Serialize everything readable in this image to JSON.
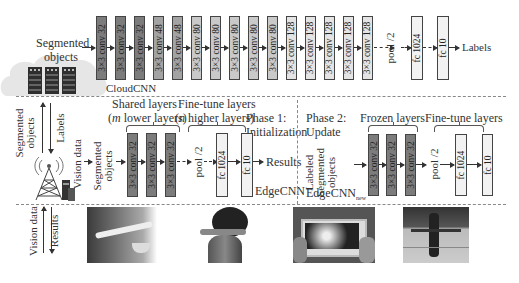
{
  "cloud": {
    "input_label_line1": "Segmented",
    "input_label_line2": "objects",
    "network_name": "CloudCNN",
    "layers": [
      {
        "label": "3×3 conv 32",
        "shade": "dark"
      },
      {
        "label": "3×3 conv 32",
        "shade": "dark"
      },
      {
        "label": "3×3 conv 32",
        "shade": "dark"
      },
      {
        "label": "3×3 conv 48",
        "shade": "mid"
      },
      {
        "label": "3×3 conv 48",
        "shade": "mid"
      },
      {
        "label": "3×3 conv 80",
        "shade": "lite"
      },
      {
        "label": "3×3 conv 80",
        "shade": "lite"
      },
      {
        "label": "3×3 conv 80",
        "shade": "lite"
      },
      {
        "label": "3×3 conv 80",
        "shade": "lite"
      },
      {
        "label": "3×3 conv 80",
        "shade": "lite"
      },
      {
        "label": "3×3 conv 128",
        "shade": "pale"
      },
      {
        "label": "3×3 conv 128",
        "shade": "pale"
      },
      {
        "label": "3×3 conv 128",
        "shade": "pale"
      },
      {
        "label": "3×3 conv 128",
        "shade": "pale"
      },
      {
        "label": "3×3 conv 128",
        "shade": "pale"
      }
    ],
    "pool_label": "pool /2",
    "fc1_label": "fc 1024",
    "fc2_label": "fc 10",
    "output_label": "Labels"
  },
  "link_cloud_edge": {
    "up_label_line1": "Segmented",
    "up_label_line2": "objects",
    "down_label": "Labels"
  },
  "edge": {
    "vision_data_label": "Vision data",
    "input_label_line1": "Segmented",
    "input_label_line2": "objects",
    "shared_title": "Shared layers",
    "shared_sub_prefix": "(",
    "shared_sub_var": "m",
    "shared_sub_rest": " lower layers)",
    "finetune_title": "Fine-tune layers",
    "finetune_sub_prefix": "(",
    "finetune_sub_var": "n",
    "finetune_sub_rest": " higher layers)",
    "phase1_line1": "Phase 1:",
    "phase1_line2": "Initialization",
    "layers": [
      "3×3 conv 32",
      "3×3 conv 32",
      "3×3 conv 32"
    ],
    "pool_label": "pool /2",
    "fc1_label": "fc 1024",
    "fc2_label": "fc 10",
    "output_label": "Results",
    "network_name": "EdgeCNN"
  },
  "update": {
    "phase2_line1": "Phase 2:",
    "phase2_line2": "Update",
    "input_line1": "Labeled",
    "input_line2": "Segmented",
    "input_line3": "objects",
    "frozen_title": "Frozen layers",
    "finetune_title": "Fine-tune layers",
    "layers": [
      "3×3 conv 32",
      "3×3 conv 32",
      "3×3 conv 32"
    ],
    "pool_label": "pool /2",
    "fc1_label": "fc 1024",
    "fc2_label": "fc 10",
    "network_name": "EdgeCNN",
    "network_subscript": "new"
  },
  "link_edge_device": {
    "up_label": "Vision data",
    "down_label": "Results"
  },
  "devices": [
    {
      "name": "smart-glasses-photo"
    },
    {
      "name": "ar-headset-photo"
    },
    {
      "name": "smartphone-ar-photo"
    },
    {
      "name": "surveillance-camera-photo"
    }
  ]
}
